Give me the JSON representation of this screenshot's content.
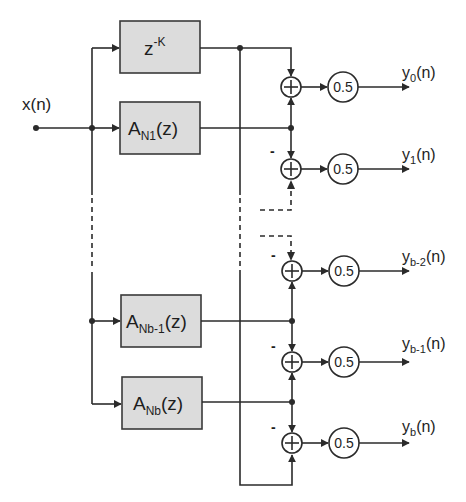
{
  "diagram": {
    "input": {
      "label": "x(n)"
    },
    "blocks": [
      {
        "id": "delay",
        "main": "z",
        "sup": "-K",
        "sub": "",
        "suffix": ""
      },
      {
        "id": "A_N1",
        "main": "A",
        "sup": "",
        "sub": "N1",
        "suffix": "(z)"
      },
      {
        "id": "A_Nb-1",
        "main": "A",
        "sup": "",
        "sub": "Nb-1",
        "suffix": "(z)"
      },
      {
        "id": "A_Nb",
        "main": "A",
        "sup": "",
        "sub": "Nb",
        "suffix": "(z)"
      }
    ],
    "summers": [
      {
        "id": "sum0",
        "symbol": "+",
        "minus_sign": ""
      },
      {
        "id": "sum1",
        "symbol": "+",
        "minus_sign": "-"
      },
      {
        "id": "sum_b-2",
        "symbol": "+",
        "minus_sign": "-"
      },
      {
        "id": "sum_b-1",
        "symbol": "+",
        "minus_sign": "-"
      },
      {
        "id": "sum_b",
        "symbol": "+",
        "minus_sign": "-"
      }
    ],
    "gains": [
      {
        "value": "0.5"
      },
      {
        "value": "0.5"
      },
      {
        "value": "0.5"
      },
      {
        "value": "0.5"
      },
      {
        "value": "0.5"
      }
    ],
    "outputs": [
      {
        "main": "y",
        "sub": "0",
        "suffix": "(n)"
      },
      {
        "main": "y",
        "sub": "1",
        "suffix": "(n)"
      },
      {
        "main": "y",
        "sub": "b-2",
        "suffix": "(n)"
      },
      {
        "main": "y",
        "sub": "b-1",
        "suffix": "(n)"
      },
      {
        "main": "y",
        "sub": "b",
        "suffix": "(n)"
      }
    ],
    "colors": {
      "line": "#2b2b2b",
      "block_fill": "#dcdcdc",
      "background": "#ffffff"
    }
  }
}
